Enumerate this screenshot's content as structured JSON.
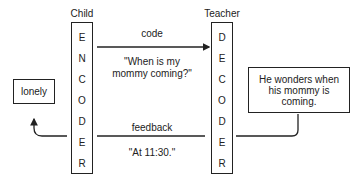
{
  "sender": {
    "title": "Child",
    "box_label": [
      "E",
      "N",
      "C",
      "O",
      "D",
      "E",
      "R"
    ]
  },
  "receiver": {
    "title": "Teacher",
    "box_label": [
      "D",
      "E",
      "C",
      "O",
      "D",
      "E",
      "R"
    ]
  },
  "forward_channel": {
    "label": "code",
    "message": "\"When is my mommy coming?\"",
    "message_line1": "\"When is my",
    "message_line2": "mommy coming?\""
  },
  "feedback_channel": {
    "label": "feedback",
    "message": "\"At 11:30.\""
  },
  "receiver_state": {
    "text": "He wonders when his mommy is coming.",
    "line1": "He wonders when",
    "line2": "his mommy is",
    "line3": "coming."
  },
  "sender_state": {
    "text": "lonely"
  }
}
